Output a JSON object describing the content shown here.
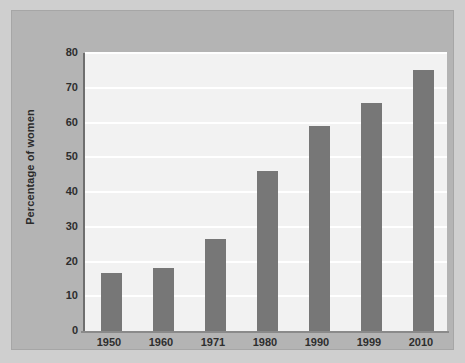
{
  "chart_data": {
    "type": "bar",
    "title": "",
    "subtitle": "",
    "xlabel": "",
    "ylabel": "Percentage of women",
    "categories": [
      "1950",
      "1960",
      "1971",
      "1980",
      "1990",
      "1999",
      "2010"
    ],
    "values": [
      16.7,
      18,
      26.5,
      46,
      59,
      65.5,
      75
    ],
    "series": [
      {
        "name": "Percentage of women",
        "values": [
          16.7,
          18,
          26.5,
          46,
          59,
          65.5,
          75
        ]
      }
    ],
    "ylim": [
      0,
      80
    ],
    "yticks": [
      0,
      10,
      20,
      30,
      40,
      50,
      60,
      70,
      80
    ],
    "ytick_labels": [
      "0",
      "10",
      "20",
      "30",
      "40",
      "50",
      "60",
      "70",
      "80"
    ],
    "xtick_labels": [
      "1950",
      "1960",
      "1971",
      "1980",
      "1990",
      "1999",
      "2010"
    ],
    "grid": true,
    "grid_axis": "y",
    "grid_color": "#ffffff",
    "legend": false,
    "legend_position": "none",
    "bar_color": "#777777",
    "plot_background": "#f2f2f2",
    "panel_background": "#b4b4b4",
    "figure_background": "#cfcfcf",
    "axis_color": "#6f6f6f",
    "text_color": "#2e2e2e"
  }
}
